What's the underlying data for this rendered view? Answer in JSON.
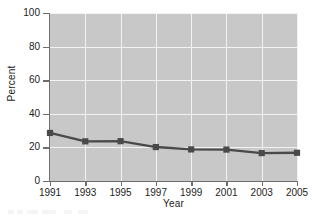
{
  "chart_data": {
    "type": "line",
    "title": "",
    "xlabel": "Year",
    "ylabel": "Percent",
    "x": [
      1991,
      1993,
      1995,
      1997,
      1999,
      2001,
      2003,
      2005
    ],
    "xticklabels": [
      "1991",
      "1993",
      "1995",
      "1997",
      "1999",
      "2001",
      "2003",
      "2005"
    ],
    "values": [
      28.6,
      23.6,
      23.7,
      20.2,
      18.8,
      18.7,
      16.6,
      16.8
    ],
    "yticks": [
      0,
      20,
      40,
      60,
      80,
      100
    ],
    "yticklabels": [
      "0",
      "20",
      "40",
      "60",
      "80",
      "100"
    ],
    "ylim": [
      0,
      100
    ],
    "xlim": [
      1991,
      2005
    ],
    "grid": true,
    "legend": false,
    "series": [
      {
        "name": "Percent",
        "values": [
          28.6,
          23.6,
          23.7,
          20.2,
          18.8,
          18.7,
          16.6,
          16.8
        ]
      }
    ]
  },
  "style": {
    "plot_background": "#c8c8c8",
    "gridline_color": "#f2f2f2",
    "series_color": "#4a4a4a",
    "axis_color": "#6e6e6e",
    "text_color": "#1d1d1d",
    "page_background": "#ffffff"
  },
  "axis": {
    "ylabel": "Percent",
    "xlabel": "Year"
  }
}
